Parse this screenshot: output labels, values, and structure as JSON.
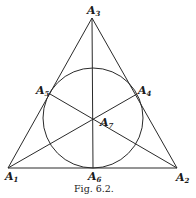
{
  "figure": {
    "caption": "Fig. 6.2.",
    "points": [
      {
        "id": "A1",
        "letter": "A",
        "sub": "1"
      },
      {
        "id": "A2",
        "letter": "A",
        "sub": "2"
      },
      {
        "id": "A3",
        "letter": "A",
        "sub": "3"
      },
      {
        "id": "A4",
        "letter": "A",
        "sub": "4"
      },
      {
        "id": "A5",
        "letter": "A",
        "sub": "5"
      },
      {
        "id": "A6",
        "letter": "A",
        "sub": "6"
      },
      {
        "id": "A7",
        "letter": "A",
        "sub": "7"
      }
    ],
    "stroke_color": "#2a2a2a",
    "background": "#ffffff"
  }
}
